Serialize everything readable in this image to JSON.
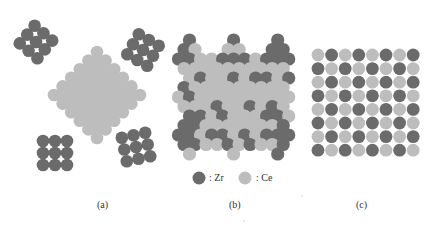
{
  "figure": {
    "panels": [
      {
        "id": "a",
        "label": "(a)",
        "description": "Separated ZrO2 clusters and CeO2 diamond domain"
      },
      {
        "id": "b",
        "label": "(b)",
        "description": "Partially mixed Zr/Ce lattice"
      },
      {
        "id": "c",
        "label": "(c)",
        "description": "Ordered Zr/Ce checkerboard solid solution"
      }
    ],
    "legend": {
      "zr_label": ": Zr",
      "ce_label": ": Ce"
    },
    "colors": {
      "zr": "#6b6b6b",
      "ce": "#bdbdbd",
      "background": "#ffffff"
    }
  }
}
